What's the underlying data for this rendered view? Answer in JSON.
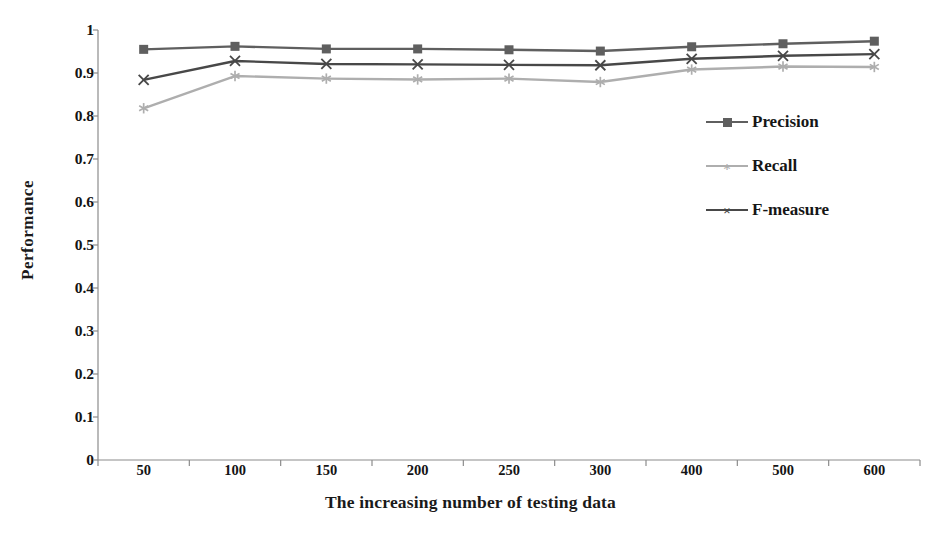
{
  "chart_data": {
    "type": "line",
    "title": "",
    "xlabel": "The increasing number of testing data",
    "ylabel": "Performance",
    "categories": [
      "50",
      "100",
      "150",
      "200",
      "250",
      "300",
      "400",
      "500",
      "600"
    ],
    "ylim": [
      0,
      1
    ],
    "yticks": [
      "0",
      "0.1",
      "0.2",
      "0.3",
      "0.4",
      "0.5",
      "0.6",
      "0.7",
      "0.8",
      "0.9",
      "1"
    ],
    "ytick_values": [
      0,
      0.1,
      0.2,
      0.3,
      0.4,
      0.5,
      0.6,
      0.7,
      0.8,
      0.9,
      1
    ],
    "grid": false,
    "legend_position": "center-right",
    "series": [
      {
        "name": "Precision",
        "color": "#5f5f5f",
        "marker": "square",
        "values": [
          0.955,
          0.962,
          0.956,
          0.956,
          0.954,
          0.951,
          0.961,
          0.968,
          0.974
        ]
      },
      {
        "name": "Recall",
        "color": "#aeaeae",
        "marker": "star",
        "values": [
          0.818,
          0.893,
          0.887,
          0.885,
          0.887,
          0.879,
          0.908,
          0.915,
          0.914
        ]
      },
      {
        "name": "F-measure",
        "color": "#484848",
        "marker": "cross",
        "values": [
          0.884,
          0.928,
          0.921,
          0.92,
          0.919,
          0.918,
          0.933,
          0.94,
          0.944
        ]
      }
    ]
  },
  "axes": {
    "axis_color": "#8c8c8c",
    "text_color": "#141414"
  }
}
